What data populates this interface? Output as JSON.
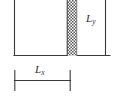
{
  "figure": {
    "kind": "technical-line-diagram",
    "width": 115,
    "height": 112,
    "background_color": "#ffffff",
    "line_color": "#3a3a3a",
    "hatch_color": "#4a4a4a",
    "label_color": "#2e2e2e"
  },
  "labels": {
    "height_label": {
      "symbol": "L",
      "subscript": "y",
      "text": "Ly"
    },
    "width_label": {
      "symbol": "L",
      "subscript": "x",
      "text": "Lx"
    }
  },
  "geometry": {
    "rectangle": {
      "left_x": 14.5,
      "right_x": 67,
      "bottom_y": 55.5,
      "top_y": 0
    },
    "hatched_wall": {
      "left_x": 67,
      "right_x": 77,
      "top_y": 0,
      "bottom_y": 55.5
    },
    "baseline": {
      "start_x": 14.5,
      "end_x": 110,
      "y": 55.5
    },
    "vertical_dimension_line": {
      "x": 105.5,
      "top_y": 0,
      "bottom_y": 55.5
    },
    "horizontal_dimension_line": {
      "y": 80.5,
      "start_x": 14.5,
      "end_x": 70.5,
      "tick_top_y": 70.5,
      "tick_bottom_y": 90.5
    }
  }
}
